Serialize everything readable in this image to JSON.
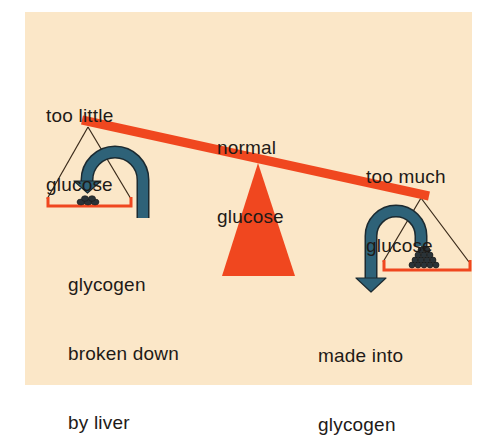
{
  "diagram": {
    "type": "balance-scale",
    "background_color": "#fbe7c8",
    "beam_color": "#f0471f",
    "arrow_color": "#2e6278",
    "labels": {
      "too_little_line1": "too little",
      "too_little_line2": "glucose",
      "normal_line1": "normal",
      "normal_line2": "glucose",
      "too_much_line1": "too much",
      "too_much_line2": "glucose",
      "broken_line1": "glycogen",
      "broken_line2": "broken down",
      "broken_line3": "by liver",
      "made_line1": "made into",
      "made_line2": "glycogen"
    },
    "nodes": [
      {
        "id": "too-little-glucose",
        "label": "too little glucose",
        "position": "left pan (raised)"
      },
      {
        "id": "normal-glucose",
        "label": "normal glucose",
        "position": "fulcrum"
      },
      {
        "id": "too-much-glucose",
        "label": "too much glucose",
        "position": "right pan (lowered)"
      }
    ],
    "edges": [
      {
        "from": "left-pan",
        "to": "left-pan",
        "label": "glycogen broken down by liver",
        "icon": "curved-arrow-down-left"
      },
      {
        "from": "right-pan",
        "to": "glycogen",
        "label": "made into glycogen",
        "icon": "curved-arrow-down-left"
      }
    ]
  }
}
